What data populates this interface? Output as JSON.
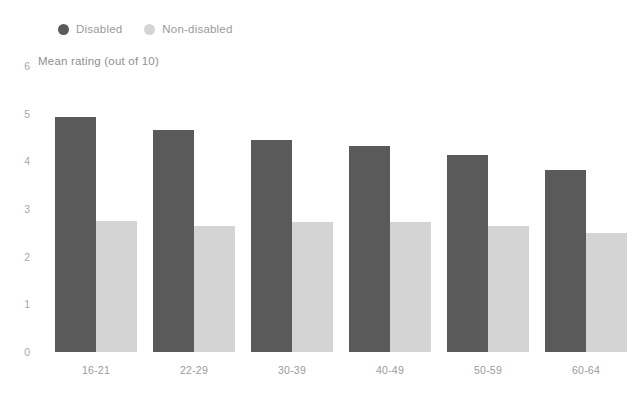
{
  "chart_data": {
    "type": "bar",
    "title": "",
    "subtitle": "",
    "xlabel": "",
    "ylabel": "Mean rating (out of 10)",
    "categories": [
      "16-21",
      "22-29",
      "30-39",
      "40-49",
      "50-59",
      "60-64"
    ],
    "series": [
      {
        "name": "Disabled",
        "color": "#5a5a5a",
        "values": [
          4.92,
          4.66,
          4.45,
          4.32,
          4.13,
          3.82
        ]
      },
      {
        "name": "Non-disabled",
        "color": "#d4d4d4",
        "values": [
          2.75,
          2.64,
          2.73,
          2.72,
          2.64,
          2.49
        ]
      }
    ],
    "ylim": [
      0,
      6
    ],
    "yticks": [
      0,
      1,
      2,
      3,
      4,
      5,
      6
    ],
    "ytick_labels": [
      "0",
      "1",
      "2",
      "3",
      "4",
      "5",
      "6"
    ],
    "grid": false,
    "legend_position": "top-left"
  },
  "legend": {
    "items": [
      {
        "label": "Disabled",
        "color": "#5a5a5a"
      },
      {
        "label": "Non-disabled",
        "color": "#d4d4d4"
      }
    ]
  },
  "axis": {
    "y_title": "Mean rating (out of 10)"
  }
}
